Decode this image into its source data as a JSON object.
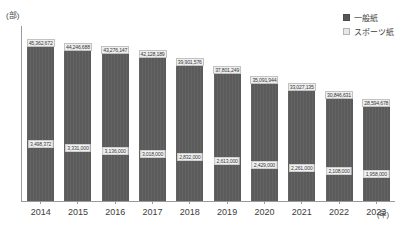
{
  "chart_data": {
    "type": "bar",
    "subtype": "stacked-vertical",
    "title": "",
    "xlabel": "年",
    "ylabel": "部",
    "y_unit_caption": "(部)",
    "x_unit_caption": "(年)",
    "categories": [
      "2014",
      "2015",
      "2016",
      "2017",
      "2018",
      "2019",
      "2020",
      "2021",
      "2022",
      "2023"
    ],
    "grid": false,
    "axis_tick_labels_shown": false,
    "ylim": [
      0,
      46000000
    ],
    "legend_position": "top-right",
    "series": [
      {
        "name": "一般紙",
        "key": "general",
        "color": "#5b5b5b",
        "values": [
          41864272,
          40277832,
          38833934,
          37128732,
          35226548,
          33186010,
          30884250,
          29116079,
          26557731,
          24576311
        ]
      },
      {
        "name": "スポーツ紙",
        "key": "sports",
        "color": "#5b5b5b",
        "values": [
          3700000,
          3550000,
          3400000,
          3200000,
          3000000,
          2800000,
          2550000,
          2400000,
          2200000,
          2050000
        ]
      }
    ],
    "total_labels": [
      "45,362,672",
      "44,246,688",
      "43,276,147",
      "42,128,189",
      "39,901,576",
      "37,801,249",
      "35,091,944",
      "33,027,135",
      "30,846,631",
      "28,594,678"
    ],
    "sports_labels": [
      "3,498,372",
      "3,331,000",
      "3,136,000",
      "3,018,000",
      "2,832,000",
      "2,613,000",
      "2,429,000",
      "2,261,000",
      "2,108,000",
      "1,958,000"
    ],
    "bar_pixel_heights": [
      162,
      158,
      155,
      151,
      143,
      135,
      125,
      118,
      110,
      102
    ],
    "sports_boundary_from_baseline": [
      57,
      53,
      50,
      47,
      44,
      40,
      36,
      33,
      30,
      27
    ]
  },
  "legend": {
    "items": [
      {
        "label": "一般紙",
        "swatch": "general"
      },
      {
        "label": "スポーツ紙",
        "swatch": "sports"
      }
    ]
  },
  "axes": {
    "y_caption": "(部)",
    "x_caption": "(年)"
  }
}
